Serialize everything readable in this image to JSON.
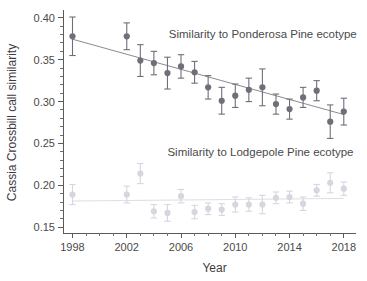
{
  "chart_data": {
    "type": "scatter",
    "title": "",
    "xlabel": "Year",
    "ylabel": "Cassia Crossbill call similarity",
    "xlim": [
      1997.3,
      2018.9
    ],
    "ylim": [
      0.143,
      0.407
    ],
    "grid": false,
    "legend_position": "inline-annotation",
    "y_ticks_major": [
      0.15,
      0.2,
      0.25,
      0.3,
      0.35,
      0.4
    ],
    "y_tick_labels": [
      "0.15",
      "0.20",
      "0.25",
      "0.30",
      "0.35",
      "0.40"
    ],
    "y_minor_step": 0.01,
    "x_ticks_major": [
      1998,
      2002,
      2006,
      2010,
      2014,
      2018
    ],
    "x_tick_labels": [
      "1998",
      "2002",
      "2006",
      "2010",
      "2014",
      "2018"
    ],
    "x_minor_step": 1,
    "marker_shape": "circle",
    "error_bar_style": "vertical-capped",
    "series": [
      {
        "name": "Similarity to Ponderosa Pine ecotype",
        "color": "#6f6f79",
        "trendline_color": "#8a8a93",
        "annotation": "Similarity to Ponderosa Pine ecotype",
        "annotation_x": 2005.1,
        "annotation_y": 0.3755,
        "trendline": {
          "x0": 1998,
          "y0": 0.3745,
          "x1": 2018,
          "y1": 0.2845
        },
        "x": [
          1998,
          2002,
          2003,
          2004,
          2005,
          2006,
          2007,
          2008,
          2009,
          2010,
          2011,
          2012,
          2013,
          2014,
          2015,
          2016,
          2017,
          2018
        ],
        "values": [
          0.378,
          0.378,
          0.349,
          0.346,
          0.334,
          0.342,
          0.335,
          0.317,
          0.301,
          0.307,
          0.314,
          0.317,
          0.297,
          0.291,
          0.305,
          0.313,
          0.276,
          0.288
        ],
        "err_low": [
          0.023,
          0.016,
          0.019,
          0.014,
          0.019,
          0.014,
          0.013,
          0.014,
          0.016,
          0.014,
          0.014,
          0.022,
          0.012,
          0.012,
          0.012,
          0.012,
          0.02,
          0.016
        ],
        "err_high": [
          0.023,
          0.016,
          0.019,
          0.014,
          0.019,
          0.014,
          0.013,
          0.014,
          0.016,
          0.014,
          0.014,
          0.022,
          0.012,
          0.012,
          0.012,
          0.012,
          0.02,
          0.016
        ]
      },
      {
        "name": "Similarity to Lodgepole Pine ecotype",
        "color": "#d6d6de",
        "trendline_color": "#dedee5",
        "annotation": "Similarity to Lodgepole Pine ecotype",
        "annotation_x": 2005.0,
        "annotation_y": 0.2345,
        "trendline": {
          "x0": 1998,
          "y0": 0.1812,
          "x1": 2018,
          "y1": 0.1843
        },
        "x": [
          1998,
          2002,
          2003,
          2004,
          2005,
          2006,
          2007,
          2008,
          2009,
          2010,
          2011,
          2012,
          2013,
          2014,
          2015,
          2016,
          2017,
          2018
        ],
        "values": [
          0.189,
          0.189,
          0.214,
          0.169,
          0.167,
          0.187,
          0.168,
          0.172,
          0.171,
          0.177,
          0.177,
          0.177,
          0.185,
          0.186,
          0.178,
          0.194,
          0.203,
          0.196
        ],
        "err_low": [
          0.012,
          0.01,
          0.012,
          0.008,
          0.01,
          0.008,
          0.008,
          0.007,
          0.007,
          0.009,
          0.008,
          0.011,
          0.007,
          0.007,
          0.008,
          0.007,
          0.012,
          0.008
        ],
        "err_high": [
          0.012,
          0.01,
          0.012,
          0.008,
          0.01,
          0.008,
          0.008,
          0.007,
          0.007,
          0.009,
          0.008,
          0.011,
          0.007,
          0.007,
          0.008,
          0.007,
          0.012,
          0.008
        ]
      }
    ]
  }
}
